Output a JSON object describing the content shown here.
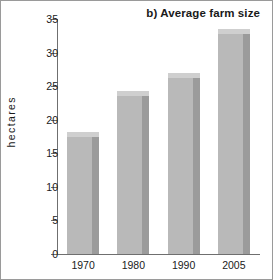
{
  "chart_data": {
    "type": "bar",
    "title": "b) Average farm size",
    "xlabel": "",
    "ylabel": "hectares",
    "categories": [
      "1970",
      "1980",
      "1990",
      "2005"
    ],
    "values": [
      17.5,
      23.6,
      26.2,
      32.7
    ],
    "ylim": [
      0,
      35
    ],
    "yticks": [
      0,
      5,
      10,
      15,
      20,
      25,
      30,
      35
    ],
    "ytick_labels": [
      "0",
      "5",
      "10",
      "15",
      "20",
      "25",
      "30",
      "35"
    ],
    "grid": false,
    "legend": null,
    "style": {
      "bar_front_color": "#b9b9b9",
      "bar_side_color": "#9b9b9b",
      "bar_top_color": "#cfcfcf",
      "axis_color": "#6f6f6f",
      "text_color": "#1a1a1a",
      "background": "#ffffff",
      "frame_color": "#9a9a9a"
    }
  }
}
